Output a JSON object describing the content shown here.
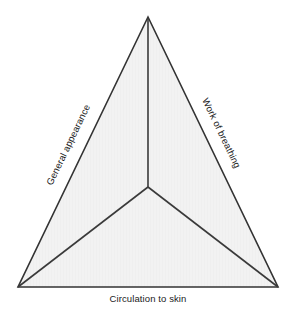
{
  "diagram": {
    "name": "pediatric-assessment-triangle",
    "background_color": "#ffffff",
    "fill_color": "#f2f2f2",
    "stroke_color": "#333333",
    "text_color": "#1a1a1a",
    "labels": {
      "left": "General appearance",
      "right": "Work of breathing",
      "bottom": "Circulation to skin"
    },
    "geometry": {
      "apex": [
        148,
        17
      ],
      "bottom_left": [
        18,
        287
      ],
      "bottom_right": [
        278,
        287
      ],
      "center": [
        148,
        187
      ]
    }
  }
}
